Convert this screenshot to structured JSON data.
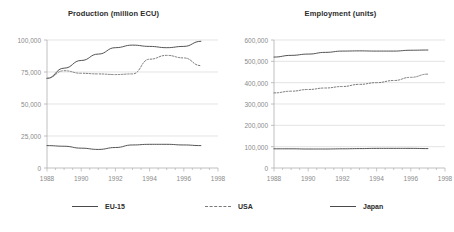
{
  "legend": {
    "position": "bottom",
    "entries": [
      {
        "label": "EU-15",
        "style": "solid",
        "color": "#4a4a4a"
      },
      {
        "label": "USA",
        "style": "dashed",
        "color": "#7a7a7a"
      },
      {
        "label": "Japan",
        "style": "solid",
        "color": "#4a4a4a"
      }
    ]
  },
  "colors": {
    "background": "#ffffff",
    "gridline": "#d9d9d9",
    "axis": "#b0b0b0",
    "tick_text": "#8a8a8a",
    "title_text": "#2b2b2b",
    "series_solid": "#4a4a4a",
    "series_dashed": "#7a7a7a"
  },
  "chart_data": [
    {
      "id": "production",
      "type": "line",
      "title": "Production (million ECU)",
      "xlabel": "",
      "ylabel": "",
      "grid": true,
      "xlim": [
        1988,
        1998
      ],
      "ylim": [
        0,
        100000
      ],
      "yticks": [
        0,
        25000,
        50000,
        75000,
        100000
      ],
      "ytick_labels": [
        "0",
        "25,000",
        "50,000",
        "75,000",
        "100,000"
      ],
      "xticks": [
        1988,
        1990,
        1992,
        1994,
        1996,
        1998
      ],
      "xtick_labels": [
        "1988",
        "1990",
        "1992",
        "1994",
        "1996",
        "1998"
      ],
      "x": [
        1988,
        1989,
        1990,
        1991,
        1992,
        1993,
        1994,
        1995,
        1996,
        1997
      ],
      "series": [
        {
          "name": "EU-15",
          "style": "solid",
          "values": [
            70000,
            78000,
            84000,
            89000,
            94000,
            96000,
            95000,
            94000,
            95000,
            99000
          ]
        },
        {
          "name": "USA",
          "style": "dashed",
          "values": [
            70000,
            76000,
            74000,
            73500,
            73000,
            73500,
            85000,
            88000,
            86000,
            80000
          ]
        },
        {
          "name": "Japan",
          "style": "solid",
          "values": [
            17500,
            17000,
            15500,
            14500,
            16000,
            18000,
            18500,
            18500,
            18000,
            17500
          ]
        }
      ]
    },
    {
      "id": "employment",
      "type": "line",
      "title": "Employment (units)",
      "xlabel": "",
      "ylabel": "",
      "grid": true,
      "xlim": [
        1988,
        1998
      ],
      "ylim": [
        0,
        600000
      ],
      "yticks": [
        0,
        100000,
        200000,
        300000,
        400000,
        500000,
        600000
      ],
      "ytick_labels": [
        "0",
        "100,000",
        "200,000",
        "300,000",
        "400,000",
        "500,000",
        "600,000"
      ],
      "xticks": [
        1988,
        1990,
        1992,
        1994,
        1996,
        1998
      ],
      "xtick_labels": [
        "1988",
        "1990",
        "1992",
        "1994",
        "1996",
        "1998"
      ],
      "x": [
        1988,
        1989,
        1990,
        1991,
        1992,
        1993,
        1994,
        1995,
        1996,
        1997
      ],
      "series": [
        {
          "name": "EU-15",
          "style": "solid",
          "values": [
            520000,
            528000,
            534000,
            542000,
            548000,
            549000,
            548000,
            548000,
            552000,
            553000
          ]
        },
        {
          "name": "USA",
          "style": "dashed",
          "values": [
            352000,
            360000,
            368000,
            375000,
            382000,
            392000,
            400000,
            410000,
            425000,
            440000
          ]
        },
        {
          "name": "Japan",
          "style": "solid",
          "values": [
            90000,
            90000,
            89000,
            89000,
            90000,
            91000,
            92000,
            92000,
            92000,
            91000
          ]
        }
      ]
    }
  ]
}
